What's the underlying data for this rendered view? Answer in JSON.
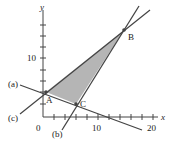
{
  "figure": {
    "type": "linear-programming feasible region",
    "axes": {
      "x_label": "x",
      "y_label": "y",
      "x_ticks": [
        "0",
        "10",
        "20"
      ],
      "y_ticks": [
        "10"
      ],
      "origin_label": "0"
    },
    "lines": [
      {
        "label": "(a)"
      },
      {
        "label": "(b)"
      },
      {
        "label": "(c)"
      }
    ],
    "vertices": [
      {
        "label": "A",
        "x": 0.5,
        "y": 4
      },
      {
        "label": "B",
        "x": 15,
        "y": 15
      },
      {
        "label": "C",
        "x": 6,
        "y": 2
      }
    ],
    "region_fill": "#b5b5b5",
    "line_color": "#444444"
  }
}
